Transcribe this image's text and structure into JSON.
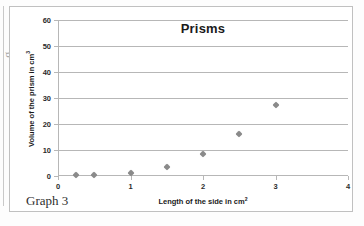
{
  "caption": "Graph 3",
  "edge_artifact": "g.",
  "chart_data": {
    "type": "scatter",
    "title": "Prisms",
    "xlabel": "Length of the side in cm²",
    "ylabel": "Volume of the prism in cm³",
    "xlim": [
      0,
      4
    ],
    "ylim": [
      0,
      60
    ],
    "xticks": [
      0,
      1,
      2,
      3,
      4
    ],
    "xtick_labels": [
      "0",
      "1",
      "2",
      "3",
      "4"
    ],
    "yticks": [
      0,
      10,
      20,
      30,
      40,
      50,
      60
    ],
    "ytick_labels": [
      "0",
      "10",
      "20",
      "30",
      "40",
      "50",
      "60"
    ],
    "grid": "horizontal",
    "legend": "none",
    "marker_shape": "diamond",
    "marker_color": "#8a8a8a",
    "x": [
      0.25,
      0.5,
      1.0,
      1.5,
      2.0,
      2.5,
      3.0
    ],
    "y": [
      0.2,
      0.3,
      1.0,
      3.5,
      8.5,
      16.0,
      27.5
    ],
    "points": [
      {
        "x": 0.25,
        "y": 0.2
      },
      {
        "x": 0.5,
        "y": 0.3
      },
      {
        "x": 1.0,
        "y": 1.0
      },
      {
        "x": 1.5,
        "y": 3.5
      },
      {
        "x": 2.0,
        "y": 8.5
      },
      {
        "x": 2.5,
        "y": 16.0
      },
      {
        "x": 3.0,
        "y": 27.5
      }
    ]
  }
}
